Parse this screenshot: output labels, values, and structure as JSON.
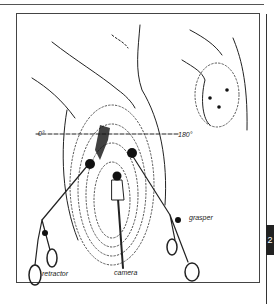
{
  "figure": {
    "labels": {
      "angle_left": "0°",
      "angle_right": "180°",
      "retractor": "retractor",
      "camera": "camera",
      "grasper": "grasper"
    },
    "page_tab": "2"
  }
}
